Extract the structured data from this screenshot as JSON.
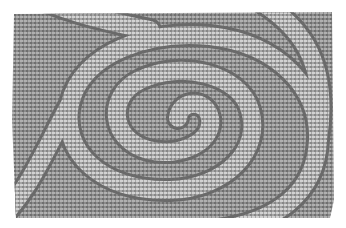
{
  "image": {
    "description": "Halftone dot-grid optical illusion with a lighter spiral band",
    "colors": {
      "background": "#ffffff",
      "base": "#8a8a8a",
      "dot_dark": "#6e6e6e",
      "dot_light": "#b4b4b4",
      "band": "#a9a9a9",
      "band_edge": "#6a6a6a"
    }
  }
}
